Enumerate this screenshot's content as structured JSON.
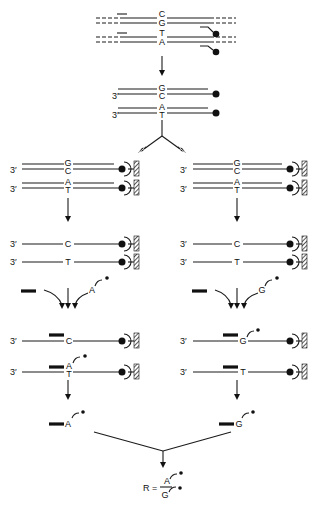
{
  "figure": {
    "title": "",
    "end_label": "3′",
    "top": {
      "strand1": {
        "top_base": "C",
        "bottom_base": "G"
      },
      "strand2": {
        "top_base": "T",
        "bottom_base": "A"
      }
    },
    "denatured": {
      "strand1": {
        "top_base": "G",
        "bottom_base": "C"
      },
      "strand2": {
        "top_base": "A",
        "bottom_base": "T"
      }
    },
    "left": {
      "captured": {
        "s1_top": "G",
        "s1_bot": "C",
        "s2_top": "A",
        "s2_bot": "T"
      },
      "single": {
        "s1": "C",
        "s2": "T"
      },
      "labeled_nucleotide": "A",
      "extended": {
        "s1": "C",
        "s2_added": "A",
        "s2": "T"
      },
      "product": "A"
    },
    "right": {
      "captured": {
        "s1_top": "G",
        "s1_bot": "C",
        "s2_top": "A",
        "s2_bot": "T"
      },
      "single": {
        "s1": "C",
        "s2": "T"
      },
      "labeled_nucleotide": "G",
      "extended": {
        "s1_added": "G",
        "s2": "T"
      },
      "product": "G"
    },
    "ratio": {
      "label": "R =",
      "numerator": "A",
      "denominator": "G"
    }
  }
}
